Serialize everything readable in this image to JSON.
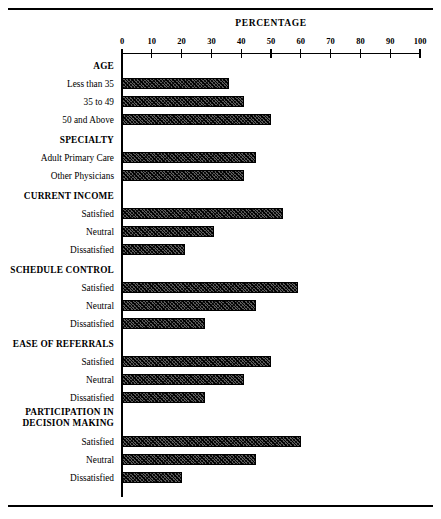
{
  "chart_data": {
    "type": "bar",
    "orientation": "horizontal",
    "title": "PERCENTAGE",
    "xlabel": "PERCENTAGE",
    "ylabel": "",
    "xlim": [
      0,
      100
    ],
    "xticks": [
      0,
      10,
      20,
      30,
      40,
      50,
      60,
      70,
      80,
      90,
      100
    ],
    "xticklabels": [
      "0",
      "10",
      "20",
      "30",
      "40",
      "50",
      "60",
      "70",
      "80",
      "90",
      "100"
    ],
    "grid": false,
    "legend": null,
    "groups": [
      {
        "name": "AGE",
        "categories": [
          "Less than 35",
          "35 to 49",
          "50 and Above"
        ],
        "values": [
          36,
          41,
          50
        ]
      },
      {
        "name": "SPECIALTY",
        "categories": [
          "Adult Primary Care",
          "Other Physicians"
        ],
        "values": [
          45,
          41
        ]
      },
      {
        "name": "CURRENT INCOME",
        "categories": [
          "Satisfied",
          "Neutral",
          "Dissatisfied"
        ],
        "values": [
          54,
          31,
          21
        ]
      },
      {
        "name": "SCHEDULE CONTROL",
        "categories": [
          "Satisfied",
          "Neutral",
          "Dissatisfied"
        ],
        "values": [
          59,
          45,
          28
        ]
      },
      {
        "name": "EASE OF REFERRALS",
        "categories": [
          "Satisfied",
          "Neutral",
          "Dissatisfied"
        ],
        "values": [
          50,
          41,
          28
        ]
      },
      {
        "name": "PARTICIPATION IN DECISION MAKING",
        "name_lines": [
          "PARTICIPATION IN",
          "DECISION MAKING"
        ],
        "categories": [
          "Satisfied",
          "Neutral",
          "Dissatisfied"
        ],
        "values": [
          60,
          45,
          20
        ]
      }
    ],
    "categories": [
      "Less than 35",
      "35 to 49",
      "50 and Above",
      "Adult Primary Care",
      "Other Physicians",
      "Satisfied",
      "Neutral",
      "Dissatisfied",
      "Satisfied",
      "Neutral",
      "Dissatisfied",
      "Satisfied",
      "Neutral",
      "Dissatisfied",
      "Satisfied",
      "Neutral",
      "Dissatisfied"
    ],
    "values": [
      36,
      41,
      50,
      45,
      41,
      54,
      31,
      21,
      59,
      45,
      28,
      50,
      41,
      28,
      60,
      45,
      20
    ],
    "colors": {
      "bar_fill": "#5a5a5a",
      "bar_edge": "#000000",
      "axis": "#000000",
      "background": "#ffffff"
    }
  }
}
